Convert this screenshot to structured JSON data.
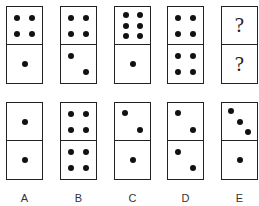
{
  "puzzle": {
    "sequence": [
      {
        "top": 4,
        "bottom": 1
      },
      {
        "top": 4,
        "bottom": 2
      },
      {
        "top": 6,
        "bottom": 1
      },
      {
        "top": 4,
        "bottom": 4
      },
      {
        "top": "?",
        "bottom": "?"
      }
    ],
    "options": [
      {
        "label": "A",
        "top": 1,
        "bottom": 1
      },
      {
        "label": "B",
        "top": 4,
        "bottom": 4
      },
      {
        "label": "C",
        "top": 2,
        "bottom": 1
      },
      {
        "label": "D",
        "top": 2,
        "bottom": 2
      },
      {
        "label": "E",
        "top": 3,
        "bottom": 1
      }
    ],
    "question_mark": "?"
  }
}
